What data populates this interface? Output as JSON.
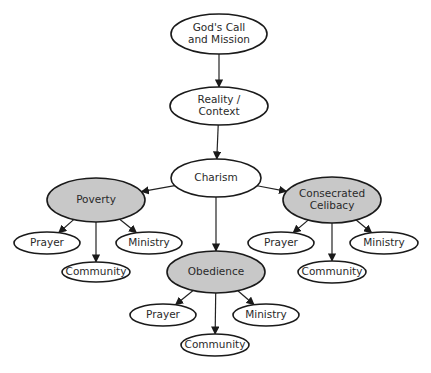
{
  "diagram": {
    "type": "hierarchy-flowchart",
    "colors": {
      "primary_fill": "#ffffff",
      "vow_fill": "#c8c8c8",
      "stroke": "#1a1a1a"
    },
    "nodes": [
      {
        "id": "call",
        "lines": [
          "God's Call",
          "and Mission"
        ],
        "style": "primary"
      },
      {
        "id": "reality",
        "lines": [
          "Reality /",
          "Context"
        ],
        "style": "primary"
      },
      {
        "id": "charism",
        "lines": [
          "Charism"
        ],
        "style": "primary"
      },
      {
        "id": "poverty",
        "lines": [
          "Poverty"
        ],
        "style": "vow"
      },
      {
        "id": "celibacy",
        "lines": [
          "Consecrated",
          "Celibacy"
        ],
        "style": "vow"
      },
      {
        "id": "obedience",
        "lines": [
          "Obedience"
        ],
        "style": "vow"
      },
      {
        "id": "pov-prayer",
        "lines": [
          "Prayer"
        ],
        "style": "primary"
      },
      {
        "id": "pov-ministry",
        "lines": [
          "Ministry"
        ],
        "style": "primary"
      },
      {
        "id": "pov-community",
        "lines": [
          "Community"
        ],
        "style": "primary"
      },
      {
        "id": "cel-prayer",
        "lines": [
          "Prayer"
        ],
        "style": "primary"
      },
      {
        "id": "cel-ministry",
        "lines": [
          "Ministry"
        ],
        "style": "primary"
      },
      {
        "id": "cel-community",
        "lines": [
          "Community"
        ],
        "style": "primary"
      },
      {
        "id": "obe-prayer",
        "lines": [
          "Prayer"
        ],
        "style": "primary"
      },
      {
        "id": "obe-ministry",
        "lines": [
          "Ministry"
        ],
        "style": "primary"
      },
      {
        "id": "obe-community",
        "lines": [
          "Community"
        ],
        "style": "primary"
      }
    ],
    "edges": [
      {
        "from": "call",
        "to": "reality"
      },
      {
        "from": "reality",
        "to": "charism"
      },
      {
        "from": "charism",
        "to": "poverty"
      },
      {
        "from": "charism",
        "to": "celibacy"
      },
      {
        "from": "charism",
        "to": "obedience"
      },
      {
        "from": "poverty",
        "to": "pov-prayer"
      },
      {
        "from": "poverty",
        "to": "pov-community"
      },
      {
        "from": "poverty",
        "to": "pov-ministry"
      },
      {
        "from": "celibacy",
        "to": "cel-prayer"
      },
      {
        "from": "celibacy",
        "to": "cel-community"
      },
      {
        "from": "celibacy",
        "to": "cel-ministry"
      },
      {
        "from": "obedience",
        "to": "obe-prayer"
      },
      {
        "from": "obedience",
        "to": "obe-community"
      },
      {
        "from": "obedience",
        "to": "obe-ministry"
      }
    ]
  }
}
